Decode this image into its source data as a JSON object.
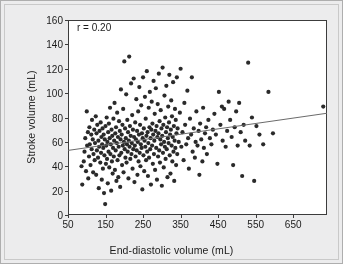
{
  "chart_data": {
    "type": "scatter",
    "title": "",
    "xlabel": "End-diastolic volume (mL)",
    "ylabel": "Stroke volume (mL)",
    "xlim": [
      50,
      740
    ],
    "ylim": [
      0,
      160
    ],
    "xticks": [
      50,
      150,
      250,
      350,
      450,
      550,
      650
    ],
    "xtick_labels": [
      "50",
      "150",
      "250",
      "350",
      "450",
      "550",
      "650"
    ],
    "yticks": [
      0,
      20,
      40,
      60,
      80,
      100,
      120,
      140,
      160
    ],
    "ytick_labels": [
      "0",
      "20",
      "40",
      "60",
      "80",
      "100",
      "120",
      "140",
      "160"
    ],
    "grid": false,
    "legend": null,
    "annotations": [
      {
        "text": "r = 0.20",
        "x": 70,
        "y": 152
      }
    ],
    "marker": {
      "shape": "circle",
      "size": 2.1,
      "color": "#2a2a2a"
    },
    "trendline": {
      "type": "linear",
      "color": "#6b6b6b",
      "width": 1,
      "x": [
        50,
        740
      ],
      "y": [
        53.0,
        83.5
      ]
    },
    "points": [
      [
        86,
        40
      ],
      [
        88,
        25
      ],
      [
        92,
        44
      ],
      [
        94,
        52
      ],
      [
        96,
        63
      ],
      [
        98,
        36
      ],
      [
        100,
        85
      ],
      [
        101,
        57
      ],
      [
        103,
        68
      ],
      [
        104,
        30
      ],
      [
        106,
        48
      ],
      [
        107,
        72
      ],
      [
        108,
        58
      ],
      [
        110,
        41
      ],
      [
        112,
        66
      ],
      [
        113,
        54
      ],
      [
        114,
        78
      ],
      [
        116,
        62
      ],
      [
        117,
        35
      ],
      [
        118,
        50
      ],
      [
        120,
        70
      ],
      [
        121,
        45
      ],
      [
        122,
        59
      ],
      [
        124,
        81
      ],
      [
        125,
        33
      ],
      [
        126,
        67
      ],
      [
        127,
        53
      ],
      [
        128,
        74
      ],
      [
        130,
        47
      ],
      [
        131,
        61
      ],
      [
        132,
        22
      ],
      [
        133,
        56
      ],
      [
        134,
        69
      ],
      [
        136,
        43
      ],
      [
        137,
        76
      ],
      [
        138,
        51
      ],
      [
        139,
        64
      ],
      [
        140,
        29
      ],
      [
        141,
        58
      ],
      [
        142,
        71
      ],
      [
        143,
        38
      ],
      [
        144,
        55
      ],
      [
        145,
        66
      ],
      [
        146,
        18
      ],
      [
        147,
        49
      ],
      [
        148,
        62
      ],
      [
        149,
        9
      ],
      [
        150,
        73
      ],
      [
        151,
        42
      ],
      [
        152,
        57
      ],
      [
        153,
        80
      ],
      [
        154,
        46
      ],
      [
        155,
        60
      ],
      [
        156,
        26
      ],
      [
        157,
        68
      ],
      [
        158,
        52
      ],
      [
        159,
        75
      ],
      [
        160,
        39
      ],
      [
        161,
        63
      ],
      [
        162,
        88
      ],
      [
        163,
        50
      ],
      [
        164,
        58
      ],
      [
        165,
        20
      ],
      [
        166,
        70
      ],
      [
        167,
        44
      ],
      [
        168,
        65
      ],
      [
        169,
        34
      ],
      [
        170,
        55
      ],
      [
        171,
        79
      ],
      [
        172,
        48
      ],
      [
        173,
        61
      ],
      [
        174,
        92
      ],
      [
        175,
        37
      ],
      [
        176,
        67
      ],
      [
        177,
        53
      ],
      [
        178,
        72
      ],
      [
        179,
        28
      ],
      [
        180,
        59
      ],
      [
        181,
        84
      ],
      [
        182,
        45
      ],
      [
        183,
        64
      ],
      [
        184,
        31
      ],
      [
        185,
        56
      ],
      [
        186,
        77
      ],
      [
        187,
        49
      ],
      [
        188,
        69
      ],
      [
        189,
        23
      ],
      [
        190,
        62
      ],
      [
        191,
        103
      ],
      [
        192,
        51
      ],
      [
        193,
        66
      ],
      [
        194,
        41
      ],
      [
        195,
        74
      ],
      [
        196,
        57
      ],
      [
        197,
        87
      ],
      [
        198,
        35
      ],
      [
        199,
        60
      ],
      [
        200,
        126
      ],
      [
        201,
        54
      ],
      [
        202,
        71
      ],
      [
        203,
        47
      ],
      [
        204,
        63
      ],
      [
        205,
        99
      ],
      [
        206,
        43
      ],
      [
        207,
        58
      ],
      [
        208,
        78
      ],
      [
        209,
        52
      ],
      [
        210,
        68
      ],
      [
        211,
        30
      ],
      [
        212,
        61
      ],
      [
        213,
        130
      ],
      [
        214,
        56
      ],
      [
        215,
        73
      ],
      [
        216,
        46
      ],
      [
        217,
        65
      ],
      [
        218,
        108
      ],
      [
        219,
        50
      ],
      [
        220,
        59
      ],
      [
        221,
        82
      ],
      [
        222,
        38
      ],
      [
        223,
        70
      ],
      [
        224,
        54
      ],
      [
        225,
        112
      ],
      [
        226,
        64
      ],
      [
        227,
        27
      ],
      [
        228,
        57
      ],
      [
        229,
        76
      ],
      [
        230,
        48
      ],
      [
        231,
        62
      ],
      [
        232,
        95
      ],
      [
        233,
        53
      ],
      [
        234,
        69
      ],
      [
        235,
        33
      ],
      [
        236,
        60
      ],
      [
        237,
        85
      ],
      [
        238,
        44
      ],
      [
        239,
        66
      ],
      [
        240,
        105
      ],
      [
        241,
        51
      ],
      [
        242,
        74
      ],
      [
        243,
        40
      ],
      [
        244,
        58
      ],
      [
        245,
        90
      ],
      [
        246,
        55
      ],
      [
        247,
        67
      ],
      [
        248,
        21
      ],
      [
        249,
        63
      ],
      [
        250,
        113
      ],
      [
        251,
        49
      ],
      [
        252,
        71
      ],
      [
        253,
        36
      ],
      [
        254,
        61
      ],
      [
        255,
        97
      ],
      [
        256,
        56
      ],
      [
        257,
        79
      ],
      [
        258,
        45
      ],
      [
        259,
        65
      ],
      [
        260,
        118
      ],
      [
        261,
        52
      ],
      [
        262,
        68
      ],
      [
        263,
        32
      ],
      [
        264,
        59
      ],
      [
        265,
        88
      ],
      [
        266,
        47
      ],
      [
        267,
        72
      ],
      [
        268,
        101
      ],
      [
        269,
        54
      ],
      [
        270,
        63
      ],
      [
        271,
        25
      ],
      [
        272,
        70
      ],
      [
        273,
        93
      ],
      [
        274,
        57
      ],
      [
        275,
        75
      ],
      [
        276,
        42
      ],
      [
        277,
        66
      ],
      [
        278,
        110
      ],
      [
        279,
        50
      ],
      [
        280,
        61
      ],
      [
        281,
        83
      ],
      [
        282,
        37
      ],
      [
        283,
        69
      ],
      [
        284,
        104
      ],
      [
        285,
        55
      ],
      [
        286,
        73
      ],
      [
        287,
        29
      ],
      [
        288,
        64
      ],
      [
        289,
        91
      ],
      [
        290,
        48
      ],
      [
        291,
        67
      ],
      [
        292,
        116
      ],
      [
        293,
        53
      ],
      [
        294,
        77
      ],
      [
        295,
        43
      ],
      [
        296,
        62
      ],
      [
        297,
        86
      ],
      [
        298,
        58
      ],
      [
        299,
        71
      ],
      [
        300,
        24
      ],
      [
        301,
        65
      ],
      [
        302,
        121
      ],
      [
        303,
        51
      ],
      [
        304,
        74
      ],
      [
        305,
        39
      ],
      [
        306,
        60
      ],
      [
        307,
        98
      ],
      [
        308,
        56
      ],
      [
        309,
        80
      ],
      [
        310,
        46
      ],
      [
        311,
        68
      ],
      [
        312,
        106
      ],
      [
        313,
        54
      ],
      [
        314,
        72
      ],
      [
        315,
        31
      ],
      [
        316,
        63
      ],
      [
        317,
        89
      ],
      [
        318,
        59
      ],
      [
        319,
        76
      ],
      [
        320,
        115
      ],
      [
        321,
        49
      ],
      [
        322,
        66
      ],
      [
        323,
        34
      ],
      [
        324,
        70
      ],
      [
        325,
        94
      ],
      [
        326,
        57
      ],
      [
        327,
        81
      ],
      [
        328,
        44
      ],
      [
        329,
        64
      ],
      [
        330,
        109
      ],
      [
        331,
        52
      ],
      [
        332,
        73
      ],
      [
        333,
        28
      ],
      [
        334,
        61
      ],
      [
        335,
        87
      ],
      [
        336,
        55
      ],
      [
        337,
        78
      ],
      [
        338,
        41
      ],
      [
        339,
        67
      ],
      [
        340,
        113
      ],
      [
        341,
        50
      ],
      [
        342,
        71
      ],
      [
        345,
        60
      ],
      [
        348,
        84
      ],
      [
        350,
        120
      ],
      [
        352,
        56
      ],
      [
        355,
        68
      ],
      [
        358,
        45
      ],
      [
        360,
        92
      ],
      [
        362,
        74
      ],
      [
        365,
        58
      ],
      [
        368,
        102
      ],
      [
        370,
        63
      ],
      [
        372,
        38
      ],
      [
        375,
        79
      ],
      [
        378,
        66
      ],
      [
        380,
        113
      ],
      [
        382,
        52
      ],
      [
        385,
        71
      ],
      [
        388,
        47
      ],
      [
        390,
        60
      ],
      [
        392,
        85
      ],
      [
        395,
        57
      ],
      [
        398,
        69
      ],
      [
        400,
        33
      ],
      [
        402,
        75
      ],
      [
        405,
        62
      ],
      [
        408,
        44
      ],
      [
        410,
        88
      ],
      [
        412,
        55
      ],
      [
        415,
        67
      ],
      [
        418,
        72
      ],
      [
        420,
        50
      ],
      [
        424,
        78
      ],
      [
        428,
        63
      ],
      [
        432,
        58
      ],
      [
        436,
        70
      ],
      [
        440,
        83
      ],
      [
        444,
        66
      ],
      [
        448,
        42
      ],
      [
        452,
        101
      ],
      [
        456,
        74
      ],
      [
        460,
        89
      ],
      [
        462,
        61
      ],
      [
        466,
        87
      ],
      [
        470,
        56
      ],
      [
        474,
        69
      ],
      [
        478,
        93
      ],
      [
        482,
        78
      ],
      [
        486,
        64
      ],
      [
        490,
        41
      ],
      [
        494,
        72
      ],
      [
        498,
        85
      ],
      [
        502,
        57
      ],
      [
        506,
        92
      ],
      [
        510,
        68
      ],
      [
        514,
        32
      ],
      [
        518,
        74
      ],
      [
        522,
        61
      ],
      [
        530,
        125
      ],
      [
        534,
        57
      ],
      [
        540,
        80
      ],
      [
        546,
        28
      ],
      [
        552,
        73
      ],
      [
        560,
        66
      ],
      [
        570,
        58
      ],
      [
        584,
        101
      ],
      [
        596,
        67
      ],
      [
        730,
        89
      ]
    ]
  }
}
